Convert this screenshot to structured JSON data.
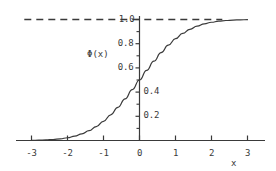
{
  "chart_data": {
    "type": "line",
    "title": "",
    "subtitle": "",
    "xlabel": "x",
    "ylabel": "Φ(x)",
    "xlim": [
      -3.35,
      3.35
    ],
    "ylim": [
      0.0,
      1.06
    ],
    "grid": false,
    "legend": null,
    "x_ticks": [
      -3,
      -2,
      -1,
      0,
      1,
      2,
      3
    ],
    "x_tick_labels": [
      "-3",
      "-2",
      "-1",
      "0",
      "1",
      "2",
      "3"
    ],
    "y_ticks": [
      0.2,
      0.4,
      0.6,
      0.8,
      1.0
    ],
    "y_tick_labels": [
      "0.2",
      "0.4",
      "0.6",
      "0.8",
      "1.0"
    ],
    "y_minor_ticks": [
      0.1,
      0.3,
      0.5,
      0.7,
      0.9
    ],
    "y_tick_label_sides": {
      "0.2": "right",
      "0.4": "right",
      "0.6": "left",
      "0.8": "left",
      "1.0": "left"
    },
    "annotations": [
      {
        "name": "asymptote",
        "style": "dashed",
        "y": 1.0,
        "x_start": -3.2,
        "x_end": 2.3,
        "label": "1.0"
      }
    ],
    "series": [
      {
        "name": "standard-normal-cdf",
        "style": "solid",
        "color": "#3a3a3a",
        "x": [
          -3.0,
          -2.8,
          -2.6,
          -2.4,
          -2.2,
          -2.0,
          -1.8,
          -1.6,
          -1.4,
          -1.2,
          -1.0,
          -0.8,
          -0.6,
          -0.4,
          -0.2,
          0.0,
          0.2,
          0.4,
          0.6,
          0.8,
          1.0,
          1.2,
          1.4,
          1.6,
          1.8,
          2.0,
          2.2,
          2.4,
          2.6,
          2.8,
          3.0
        ],
        "values": [
          0.0013,
          0.0026,
          0.0047,
          0.0082,
          0.0139,
          0.0228,
          0.0359,
          0.0548,
          0.0808,
          0.1151,
          0.1587,
          0.2119,
          0.2743,
          0.3446,
          0.4207,
          0.5,
          0.5793,
          0.6554,
          0.7257,
          0.7881,
          0.8413,
          0.8849,
          0.9192,
          0.9452,
          0.9641,
          0.9772,
          0.9861,
          0.9918,
          0.9953,
          0.9974,
          0.9987
        ]
      }
    ]
  },
  "axis_label_x": "x",
  "axis_label_y": "Φ(x)"
}
